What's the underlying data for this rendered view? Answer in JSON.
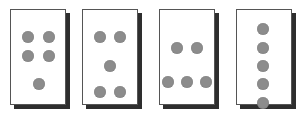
{
  "diagram": {
    "dot_color": "#8c8c8c",
    "card_shadow_color": "#2e2e2e",
    "cards": [
      {
        "id": "card-1",
        "x": 10,
        "dots": [
          [
            17,
            27
          ],
          [
            38,
            27
          ],
          [
            17,
            46
          ],
          [
            38,
            46
          ],
          [
            28,
            74
          ]
        ]
      },
      {
        "id": "card-2",
        "x": 82,
        "dots": [
          [
            17,
            27
          ],
          [
            37,
            27
          ],
          [
            27,
            56
          ],
          [
            17,
            82
          ],
          [
            37,
            82
          ]
        ]
      },
      {
        "id": "card-3",
        "x": 159,
        "dots": [
          [
            17,
            38
          ],
          [
            37,
            38
          ],
          [
            8,
            72
          ],
          [
            27,
            72
          ],
          [
            46,
            72
          ]
        ]
      },
      {
        "id": "card-4",
        "x": 236,
        "dots": [
          [
            26,
            19
          ],
          [
            26,
            38
          ],
          [
            26,
            56
          ],
          [
            26,
            74
          ],
          [
            26,
            93
          ]
        ]
      }
    ]
  }
}
